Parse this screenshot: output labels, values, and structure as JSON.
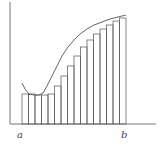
{
  "diagram": {
    "labels": {
      "a": "a",
      "b": "b"
    },
    "colors": {
      "stroke": "#555555",
      "axis": "#777777",
      "background": "#ffffff"
    },
    "axes": {
      "origin": [
        10,
        124
      ],
      "x_end": 156,
      "y_top": 2
    },
    "num_rectangles": 16,
    "interval_px": [
      22,
      126
    ],
    "curve_points": [
      [
        22,
        83
      ],
      [
        25,
        89
      ],
      [
        29,
        94
      ],
      [
        34,
        95
      ],
      [
        39,
        95
      ],
      [
        43,
        93
      ],
      [
        47,
        86
      ],
      [
        52,
        76
      ],
      [
        57,
        66
      ],
      [
        62,
        56
      ],
      [
        68,
        47
      ],
      [
        74,
        40
      ],
      [
        80,
        34
      ],
      [
        87,
        29
      ],
      [
        94,
        25
      ],
      [
        102,
        22
      ],
      [
        110,
        19
      ],
      [
        118,
        17
      ],
      [
        126,
        15
      ]
    ],
    "rect_tops": [
      94,
      94,
      95,
      95,
      94,
      86,
      76,
      66,
      56,
      47,
      40,
      34,
      29,
      25,
      21,
      18
    ]
  }
}
